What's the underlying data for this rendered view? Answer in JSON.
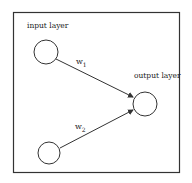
{
  "diagram": {
    "type": "neural-network",
    "frame": {
      "x": 13,
      "y": 12,
      "width": 166,
      "height": 160,
      "stroke": "#333333"
    },
    "labels": {
      "input_layer": "input layer",
      "output_layer": "output layer",
      "w1_base": "w",
      "w1_sub": "1",
      "w2_base": "w",
      "w2_sub": "2"
    },
    "nodes": [
      {
        "id": "input-1",
        "layer": "input",
        "cx": 46,
        "cy": 52,
        "r": 12
      },
      {
        "id": "input-2",
        "layer": "input",
        "cx": 49,
        "cy": 153,
        "r": 11
      },
      {
        "id": "output-1",
        "layer": "output",
        "cx": 145,
        "cy": 104,
        "r": 12
      }
    ],
    "edges": [
      {
        "from": "input-1",
        "to": "output-1",
        "weight": "w1"
      },
      {
        "from": "input-2",
        "to": "output-1",
        "weight": "w2"
      }
    ],
    "colors": {
      "stroke": "#333333",
      "text": "#222222",
      "background": "#ffffff"
    }
  }
}
